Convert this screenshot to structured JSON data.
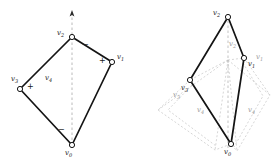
{
  "figure": {
    "panels": [
      {
        "id": "left",
        "name": "original-quadrilateral",
        "vertices": [
          {
            "id": "v0",
            "label": "v",
            "sub": "0",
            "x": 72,
            "y": 145,
            "label_x": 67,
            "label_y": 150,
            "marker": "open-circle"
          },
          {
            "id": "v1",
            "label": "v",
            "sub": "1",
            "x": 112,
            "y": 62,
            "label_x": 117,
            "label_y": 55,
            "marker": "open-circle"
          },
          {
            "id": "v2",
            "label": "v",
            "sub": "2",
            "x": 72,
            "y": 37,
            "label_x": 58,
            "label_y": 31,
            "marker": "open-circle"
          },
          {
            "id": "v3",
            "label": "v",
            "sub": "3",
            "x": 20,
            "y": 89,
            "label_x": 12,
            "label_y": 78,
            "marker": "open-circle"
          },
          {
            "id": "v4",
            "label": "v",
            "sub": "4",
            "x": 50,
            "y": 80,
            "label_x": 46,
            "label_y": 76,
            "marker": "none"
          }
        ],
        "edges": [
          {
            "from": "v0",
            "to": "v1",
            "style": "solid"
          },
          {
            "from": "v1",
            "to": "v2",
            "style": "solid"
          },
          {
            "from": "v2",
            "to": "v3",
            "style": "solid"
          },
          {
            "from": "v3",
            "to": "v0",
            "style": "solid"
          }
        ],
        "axis": {
          "x1": 72,
          "y1": 145,
          "x2": 72,
          "y2": 12,
          "style": "dashed",
          "arrow": "up"
        },
        "signs": [
          {
            "text": "−",
            "x": 85,
            "y": 44
          },
          {
            "text": "+",
            "x": 101,
            "y": 60
          },
          {
            "text": "+",
            "x": 29,
            "y": 86
          },
          {
            "text": "−",
            "x": 60,
            "y": 130
          }
        ]
      },
      {
        "id": "right",
        "name": "transformed-quadrilateral-with-ghost",
        "vertices": [
          {
            "id": "v0",
            "label": "v",
            "sub": "0",
            "x": 231,
            "y": 144,
            "label_x": 226,
            "label_y": 149,
            "marker": "open-circle"
          },
          {
            "id": "v1",
            "label": "v",
            "sub": "1",
            "x": 244,
            "y": 58,
            "label_x": 248,
            "label_y": 62,
            "marker": "open-circle"
          },
          {
            "id": "v2",
            "label": "v",
            "sub": "2",
            "x": 228,
            "y": 17,
            "label_x": 214,
            "label_y": 11,
            "marker": "open-circle"
          },
          {
            "id": "v3",
            "label": "v",
            "sub": "3",
            "x": 190,
            "y": 80,
            "label_x": 184,
            "label_y": 86,
            "marker": "open-circle"
          }
        ],
        "edges": [
          {
            "from": "v0",
            "to": "v1",
            "style": "solid"
          },
          {
            "from": "v1",
            "to": "v2",
            "style": "solid"
          },
          {
            "from": "v2",
            "to": "v3",
            "style": "solid"
          },
          {
            "from": "v3",
            "to": "v0",
            "style": "solid"
          }
        ],
        "axis": {
          "x1": 228,
          "y1": 148,
          "x2": 228,
          "y2": 17,
          "style": "dashed",
          "arrow": "none"
        },
        "ghost": {
          "color": "#bdbdbd",
          "style": "dashed",
          "left_wing": [
            [
              190,
              80
            ],
            [
              158,
              110
            ],
            [
              215,
              150
            ],
            [
              231,
              144
            ]
          ],
          "left_wing_inner": [
            [
              190,
              80
            ],
            [
              168,
              112
            ],
            [
              218,
              146
            ]
          ],
          "right_wing": [
            [
              244,
              58
            ],
            [
              270,
              95
            ],
            [
              237,
              150
            ],
            [
              231,
              144
            ]
          ],
          "right_wing_inner": [
            [
              244,
              58
            ],
            [
              262,
              96
            ],
            [
              234,
              146
            ]
          ],
          "cross_left": [
            [
              228,
              17
            ],
            [
              190,
              80
            ]
          ],
          "cross_right": [
            [
              228,
              17
            ],
            [
              244,
              58
            ]
          ],
          "spread_left": [
            [
              228,
              60
            ],
            [
              158,
              110
            ]
          ],
          "spread_right": [
            [
              228,
              60
            ],
            [
              270,
              95
            ]
          ],
          "spread_down_left": [
            [
              228,
              60
            ],
            [
              215,
              150
            ]
          ],
          "spread_down_right": [
            [
              228,
              60
            ],
            [
              237,
              150
            ]
          ],
          "hub": [
            228,
            60
          ]
        },
        "ghost_labels": [
          {
            "label": "v",
            "sub": "2",
            "x": 231,
            "y": 44
          },
          {
            "label": "v",
            "sub": "1",
            "x": 257,
            "y": 57
          },
          {
            "label": "v",
            "sub": "3",
            "x": 175,
            "y": 95
          },
          {
            "label": "v",
            "sub": "4",
            "x": 200,
            "y": 110
          },
          {
            "label": "v",
            "sub": "4",
            "x": 250,
            "y": 110
          }
        ]
      }
    ],
    "colors": {
      "stroke": "#1a1a1a",
      "ghost": "#bdbdbd",
      "axis": "#9a9a9a",
      "background": "#ffffff",
      "marker_fill": "#ffffff"
    }
  }
}
